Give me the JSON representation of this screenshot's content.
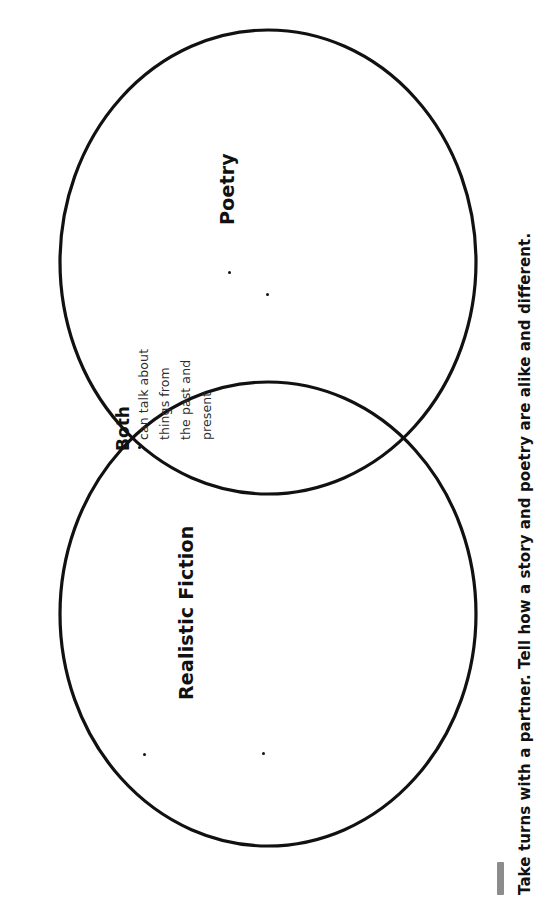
{
  "document": {
    "type": "venn-diagram-worksheet",
    "orientation": "rotated-90-counterclockwise",
    "background_color": "#ffffff",
    "stroke_color": "#111111"
  },
  "venn": {
    "left_circle": {
      "label": "Realistic Fiction",
      "bullet_count": 2,
      "bullets": []
    },
    "right_circle": {
      "label": "Poetry",
      "bullet_count": 2,
      "bullets": []
    },
    "overlap": {
      "label": "Both",
      "bullet_lines": [
        "can talk about",
        "things from",
        "the past and",
        "present"
      ],
      "bullet_text": "can talk about things from the past and present"
    }
  },
  "caption": {
    "text": "Take turns with a partner. Tell how a story and poetry are alike and different.",
    "accent_color": "#8c8c8c"
  }
}
